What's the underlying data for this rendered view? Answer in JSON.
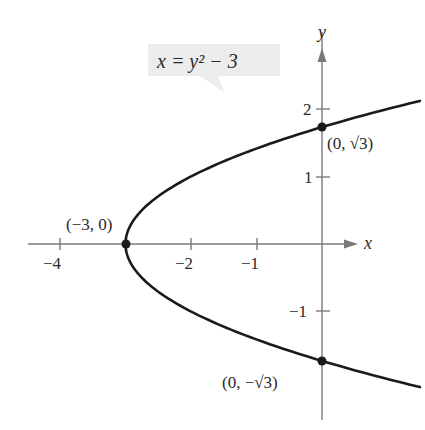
{
  "chart_data": {
    "type": "line",
    "title": "",
    "equation_label": "x = y² − 3",
    "xlabel": "x",
    "ylabel": "y",
    "xlim": [
      -4.5,
      0.8
    ],
    "ylim": [
      -2.5,
      2.5
    ],
    "x_ticks": [
      {
        "value": -4,
        "label": "−4"
      },
      {
        "value": -2,
        "label": "−2"
      },
      {
        "value": -1,
        "label": "−1"
      }
    ],
    "y_ticks": [
      {
        "value": 2,
        "label": "2"
      },
      {
        "value": 1,
        "label": "1"
      },
      {
        "value": -1,
        "label": "−1"
      }
    ],
    "series": [
      {
        "name": "x = y^2 - 3",
        "curve": "parabola",
        "y_range": [
          -2.12,
          2.12
        ]
      }
    ],
    "points": [
      {
        "x": -3,
        "y": 0,
        "label": "(−3, 0)"
      },
      {
        "x": 0,
        "y": 1.732,
        "label": "(0, √3)"
      },
      {
        "x": 0,
        "y": -1.732,
        "label": "(0, −√3)"
      }
    ],
    "grid": false,
    "colors": {
      "curve": "#1a1a1a",
      "axis": "#7a7a7a",
      "label_box": "#ececec"
    }
  }
}
